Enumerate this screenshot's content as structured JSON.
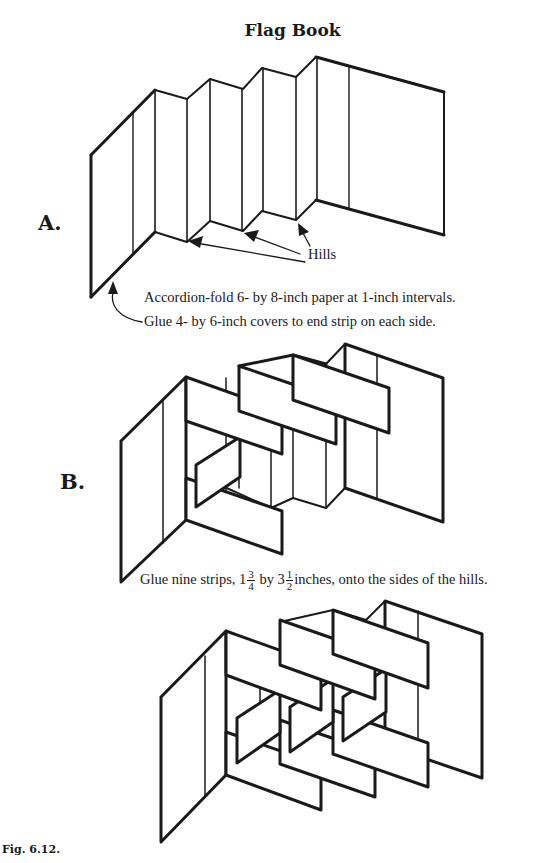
{
  "title": "Flag Book",
  "figure_label": "Fig. 6.12.",
  "section_a": {
    "letter": "A.",
    "hills_label": "Hills",
    "caption_fold": "Accordion-fold 6- by  8-inch paper at 1-inch intervals.",
    "caption_glue": "Glue 4- by  6-inch covers to end strip on each side."
  },
  "section_b": {
    "letter": "B.",
    "caption_prefix": "Glue nine strips, 1",
    "frac1_num": "3",
    "frac1_den": "4",
    "caption_mid": " by  3",
    "frac2_num": "1",
    "frac2_den": "2",
    "caption_suffix": "inches, onto the sides of the hills."
  },
  "section_c": {
    "description": "Completed flag book with nine flags in three rows"
  },
  "colors": {
    "ink": "#1a1a1a",
    "background": "#ffffff"
  }
}
